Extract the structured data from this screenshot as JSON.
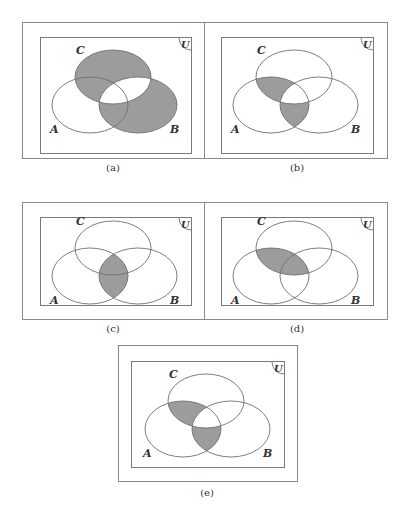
{
  "figure": {
    "universe_label": "U",
    "set_labels": {
      "A": "A",
      "B": "B",
      "C": "C"
    },
    "shade_color": "#9c9c9c",
    "panels": [
      {
        "id": "a",
        "caption": "(a)",
        "shaded_regions": [
          "C only",
          "B only",
          "A∩C−B",
          "A∩B−C"
        ],
        "expression": "B Δ C"
      },
      {
        "id": "b",
        "caption": "(b)",
        "shaded_regions": [
          "A∩C−B",
          "A∩B−C"
        ],
        "expression": "(A∩C)Δ(A∩B)"
      },
      {
        "id": "c",
        "caption": "(c)",
        "shaded_regions": [
          "A∩B"
        ],
        "expression": "A∩B"
      },
      {
        "id": "d",
        "caption": "(d)",
        "shaded_regions": [
          "A∩C"
        ],
        "expression": "A∩C"
      },
      {
        "id": "e",
        "caption": "(e)",
        "shaded_regions": [
          "A∩C−B",
          "A∩B−C"
        ],
        "expression": "A∩(B Δ C)"
      }
    ]
  }
}
